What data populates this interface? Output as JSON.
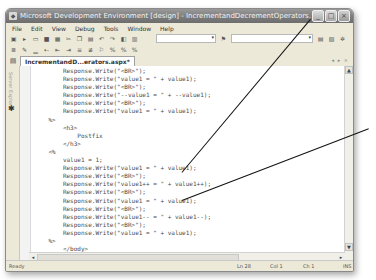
{
  "window": {
    "title": "Microsoft Development Environment [design] - IncrementandDecrementOperators.aspx*",
    "controls": {
      "minimize": "_",
      "maximize": "□",
      "close": "×"
    }
  },
  "menubar": {
    "items": [
      {
        "label": "File"
      },
      {
        "label": "Edit"
      },
      {
        "label": "View"
      },
      {
        "label": "Debug"
      },
      {
        "label": "Tools"
      },
      {
        "label": "Window"
      },
      {
        "label": "Help"
      }
    ]
  },
  "toolbar": {
    "row1_icons": [
      "new-project-icon",
      "add-item-icon",
      "open-icon",
      "save-icon",
      "save-all-icon",
      "cut-icon",
      "copy-icon",
      "paste-icon",
      "undo-icon",
      "redo-icon",
      "navigate-icon",
      "find-icon"
    ],
    "config_combo": "",
    "solution_combo": "",
    "row2_icons": [
      "indent-icon",
      "outdent-icon",
      "comment-icon",
      "uncomment-icon",
      "bookmark-icon",
      "format-icon"
    ]
  },
  "tabs": {
    "active": "IncrementandD...erators.aspx*",
    "controls": "◂ ▸ ×"
  },
  "sidebar": {
    "vertical_label": "Server Explorer",
    "toolbox_icon": "toolbox-icon"
  },
  "editor": {
    "lines": [
      "        Response.Write(\"<BR>\");",
      "        Response.Write(\"value1 = \" + value1);",
      "        Response.Write(\"<BR>\");",
      "        Response.Write(\"--value1 = \" + --value1);",
      "        Response.Write(\"<BR>\");",
      "        Response.Write(\"value1 = \" + value1);",
      "    %>",
      "        <h3>",
      "            Postfix",
      "        </h3>",
      "    <%",
      "        value1 = 1;",
      "        Response.Write(\"value1 = \" + value1);",
      "        Response.Write(\"<BR>\");",
      "        Response.Write(\"value1++ = \" + value1++);",
      "        Response.Write(\"<BR>\");",
      "        Response.Write(\"value1 = \" + value1);",
      "        Response.Write(\"<BR>\");",
      "        Response.Write(\"value1-- = \" + value1--);",
      "        Response.Write(\"<BR>\");",
      "        Response.Write(\"value1 = \" + value1);",
      "    %>",
      "        </body>",
      "    </html>"
    ]
  },
  "statusbar": {
    "status": "Ready",
    "line": "Ln 28",
    "col": "Col 1",
    "ch": "Ch 1",
    "mode": "INS"
  }
}
